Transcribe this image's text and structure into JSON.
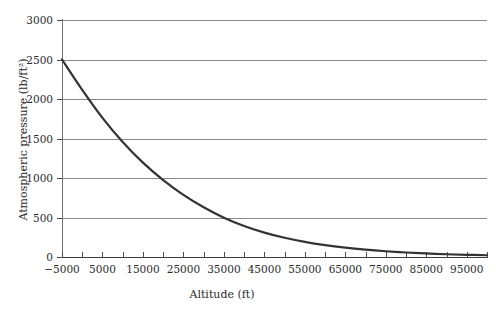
{
  "chart_data": {
    "type": "line",
    "title": "",
    "xlabel": "Altitude (ft)",
    "ylabel": "Atmospheric pressure (lb/ft²)",
    "xlim": [
      -5000,
      100000
    ],
    "ylim": [
      0,
      3000
    ],
    "grid": true,
    "legend": null,
    "line_color": "#333333",
    "grid_color": "#8a8a8a",
    "axis_color": "#3a3a3a",
    "xticks": [
      -5000,
      0,
      5000,
      10000,
      15000,
      20000,
      25000,
      30000,
      35000,
      40000,
      45000,
      50000,
      55000,
      60000,
      65000,
      70000,
      75000,
      80000,
      85000,
      90000,
      95000,
      100000
    ],
    "xtick_labels": [
      {
        "value": -5000,
        "label": "−5000"
      },
      {
        "value": 5000,
        "label": "5000"
      },
      {
        "value": 15000,
        "label": "15000"
      },
      {
        "value": 25000,
        "label": "25000"
      },
      {
        "value": 35000,
        "label": "35000"
      },
      {
        "value": 45000,
        "label": "45000"
      },
      {
        "value": 55000,
        "label": "55000"
      },
      {
        "value": 65000,
        "label": "65000"
      },
      {
        "value": 75000,
        "label": "75000"
      },
      {
        "value": 85000,
        "label": "85000"
      },
      {
        "value": 95000,
        "label": "95000"
      }
    ],
    "yticks": [
      0,
      500,
      1000,
      1500,
      2000,
      2500,
      3000
    ],
    "ytick_labels": [
      "0",
      "500",
      "1000",
      "1500",
      "2000",
      "2500",
      "3000"
    ],
    "series": [
      {
        "name": "Atmospheric pressure",
        "x": [
          -5000,
          0,
          5000,
          10000,
          15000,
          20000,
          25000,
          30000,
          35000,
          40000,
          45000,
          50000,
          55000,
          60000,
          65000,
          70000,
          75000,
          80000,
          85000,
          90000,
          95000,
          100000
        ],
        "y": [
          2500,
          2116,
          1761,
          1455,
          1194,
          973,
          786,
          629,
          498,
          393,
          309,
          243,
          191,
          150,
          118,
          93,
          73,
          57,
          45,
          35,
          28,
          22
        ]
      }
    ]
  }
}
